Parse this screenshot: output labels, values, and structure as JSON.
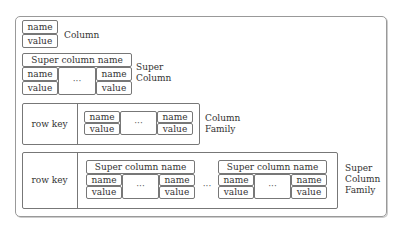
{
  "diagram": {
    "column": {
      "name": "name",
      "value": "value",
      "label": "Column"
    },
    "super_column": {
      "header": "Super column name",
      "left": {
        "name": "name",
        "value": "value"
      },
      "ellipsis": "···",
      "right": {
        "name": "name",
        "value": "value"
      },
      "label_line1": "Super",
      "label_line2": "Column"
    },
    "column_family": {
      "row_key": "row key",
      "left": {
        "name": "name",
        "value": "value"
      },
      "ellipsis": "···",
      "right": {
        "name": "name",
        "value": "value"
      },
      "label_line1": "Column",
      "label_line2": "Family"
    },
    "super_column_family": {
      "row_key": "row key",
      "super_columns": [
        {
          "header": "Super column name",
          "left": {
            "name": "name",
            "value": "value"
          },
          "ellipsis": "···",
          "right": {
            "name": "name",
            "value": "value"
          }
        },
        {
          "header": "Super column name",
          "left": {
            "name": "name",
            "value": "value"
          },
          "ellipsis": "···",
          "right": {
            "name": "name",
            "value": "value"
          }
        }
      ],
      "between_ellipsis": "···",
      "label_line1": "Super",
      "label_line2": "Column",
      "label_line3": "Family"
    },
    "colors": {
      "border": "#777777",
      "outer_border": "#999999",
      "text": "#333333"
    }
  }
}
